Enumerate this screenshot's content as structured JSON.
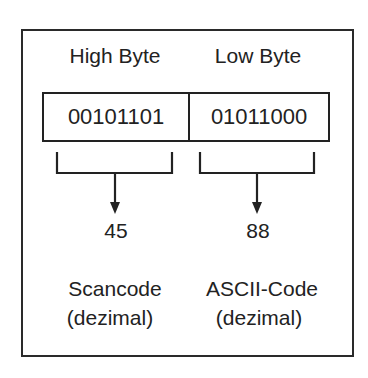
{
  "diagram": {
    "type": "byte-split",
    "high_byte": {
      "header": "High Byte",
      "bits": "00101101",
      "decimal": "45",
      "label_line1": "Scancode",
      "label_line2": "(dezimal)"
    },
    "low_byte": {
      "header": "Low Byte",
      "bits": "01011000",
      "decimal": "88",
      "label_line1": "ASCII-Code",
      "label_line2": "(dezimal)"
    },
    "colors": {
      "stroke": "#222222",
      "background": "#ffffff"
    }
  }
}
